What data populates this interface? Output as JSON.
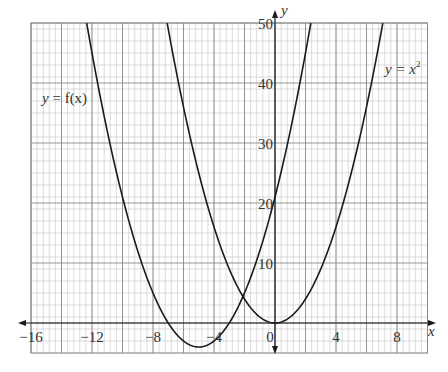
{
  "chart_data": {
    "type": "line",
    "title": "",
    "xlabel": "x",
    "ylabel": "y",
    "xlim": [
      -16,
      10
    ],
    "ylim": [
      -5,
      50
    ],
    "grid": true,
    "grid_major_x_step": 2,
    "grid_minor_x_step": 0.4,
    "grid_major_y_step": 10,
    "grid_minor_y_step": 2,
    "x_ticks": [
      {
        "value": -16,
        "label": "−16"
      },
      {
        "value": -12,
        "label": "−12"
      },
      {
        "value": -8,
        "label": "−8"
      },
      {
        "value": -4,
        "label": "−4"
      },
      {
        "value": 0,
        "label": "0"
      },
      {
        "value": 4,
        "label": "4"
      },
      {
        "value": 8,
        "label": "8"
      }
    ],
    "y_ticks": [
      {
        "value": 10,
        "label": "10"
      },
      {
        "value": 20,
        "label": "20"
      },
      {
        "value": 30,
        "label": "30"
      },
      {
        "value": 40,
        "label": "40"
      },
      {
        "value": 50,
        "label": "50"
      }
    ],
    "series": [
      {
        "name": "y = f(x)",
        "label_prefix": "y",
        "label_suffix": " = f(x)",
        "formula": "(x+5)^2 - 4",
        "x_range": [
          -12.35,
          2.35
        ],
        "points": [
          [
            -12.35,
            50
          ],
          [
            -11,
            32
          ],
          [
            -10,
            21
          ],
          [
            -9,
            12
          ],
          [
            -8,
            5
          ],
          [
            -7,
            0
          ],
          [
            -6,
            -3
          ],
          [
            -5,
            -4
          ],
          [
            -4,
            -3
          ],
          [
            -3,
            0
          ],
          [
            -2,
            5
          ],
          [
            -1,
            12
          ],
          [
            0,
            21
          ],
          [
            1,
            32
          ],
          [
            2,
            45
          ],
          [
            2.35,
            50
          ]
        ],
        "label_pos": {
          "x": 42,
          "y": 103
        }
      },
      {
        "name": "y = x²",
        "label_prefix": "y",
        "label_suffix": " = x",
        "label_sup": "2",
        "formula": "x^2",
        "x_range": [
          -7.07,
          7.07
        ],
        "points": [
          [
            -7.07,
            50
          ],
          [
            -6,
            36
          ],
          [
            -5,
            25
          ],
          [
            -4,
            16
          ],
          [
            -3,
            9
          ],
          [
            -2,
            4
          ],
          [
            -1,
            1
          ],
          [
            0,
            0
          ],
          [
            1,
            1
          ],
          [
            2,
            4
          ],
          [
            3,
            9
          ],
          [
            4,
            16
          ],
          [
            5,
            25
          ],
          [
            6,
            36
          ],
          [
            7.07,
            50
          ]
        ],
        "label_pos": {
          "x": 385,
          "y": 74
        }
      }
    ],
    "intersection": {
      "x": -2.1,
      "y": 4.41
    },
    "colors": {
      "curve": "#1a1a1a",
      "axis": "#1a1a1a",
      "grid_major": "#8a8a8a",
      "grid_minor": "#c4c4c4",
      "label": "#333333"
    }
  }
}
